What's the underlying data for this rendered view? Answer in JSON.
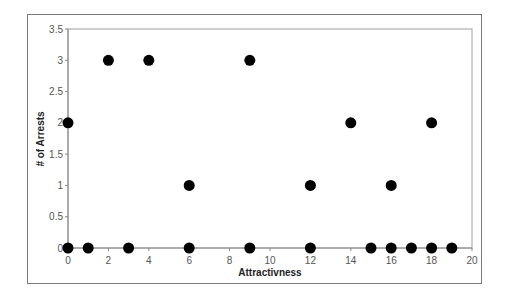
{
  "chart_data": {
    "type": "scatter",
    "title": "",
    "xlabel": "Attractivness",
    "ylabel": "# of Arrests",
    "xlim": [
      0,
      20
    ],
    "ylim": [
      0,
      3.5
    ],
    "x_ticks": [
      0,
      2,
      4,
      6,
      8,
      10,
      12,
      14,
      16,
      18,
      20
    ],
    "y_ticks": [
      0,
      0.5,
      1,
      1.5,
      2,
      2.5,
      3,
      3.5
    ],
    "x_tick_labels": [
      "0",
      "2",
      "4",
      "6",
      "8",
      "10",
      "12",
      "14",
      "16",
      "18",
      "20"
    ],
    "y_tick_labels": [
      "0",
      "0.5",
      "1",
      "1.5",
      "2",
      "2.5",
      "3",
      "3.5"
    ],
    "grid": false,
    "legend": null,
    "marker_color": "#000000",
    "series": [
      {
        "name": "Arrests vs Attractiveness",
        "points": [
          {
            "x": 0,
            "y": 2
          },
          {
            "x": 0,
            "y": 0
          },
          {
            "x": 1,
            "y": 0
          },
          {
            "x": 2,
            "y": 3
          },
          {
            "x": 3,
            "y": 0
          },
          {
            "x": 4,
            "y": 3
          },
          {
            "x": 6,
            "y": 1
          },
          {
            "x": 6,
            "y": 0
          },
          {
            "x": 9,
            "y": 3
          },
          {
            "x": 9,
            "y": 0
          },
          {
            "x": 12,
            "y": 1
          },
          {
            "x": 12,
            "y": 0
          },
          {
            "x": 14,
            "y": 2
          },
          {
            "x": 15,
            "y": 0
          },
          {
            "x": 16,
            "y": 1
          },
          {
            "x": 16,
            "y": 0
          },
          {
            "x": 17,
            "y": 0
          },
          {
            "x": 18,
            "y": 2
          },
          {
            "x": 18,
            "y": 0
          },
          {
            "x": 19,
            "y": 0
          }
        ]
      }
    ]
  }
}
